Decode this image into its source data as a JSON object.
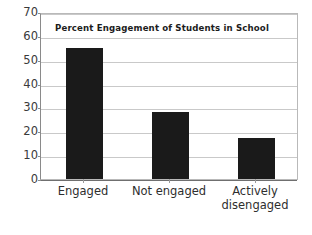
{
  "chart_data": {
    "type": "bar",
    "title": "Percent Engagement of Students in School",
    "xlabel": "",
    "ylabel": "",
    "categories": [
      "Engaged",
      "Not engaged",
      "Actively disengaged"
    ],
    "category_lines": [
      [
        "Engaged"
      ],
      [
        "Not engaged"
      ],
      [
        "Actively",
        "disengaged"
      ]
    ],
    "values": [
      55,
      28,
      17
    ],
    "ylim": [
      0,
      70
    ],
    "ytick_step": 10,
    "yticks": [
      70,
      60,
      50,
      40,
      30,
      20,
      10,
      0
    ],
    "ytick_labels": [
      "70",
      "60",
      "50",
      "40",
      "30",
      "20",
      "10",
      "0"
    ],
    "grid": true,
    "grid_axis": "y",
    "legend": false,
    "bar_color": "#1a1a1a",
    "grid_color": "#c9c9c9",
    "axis_color": "#8a8a8a",
    "background": "#ffffff"
  }
}
